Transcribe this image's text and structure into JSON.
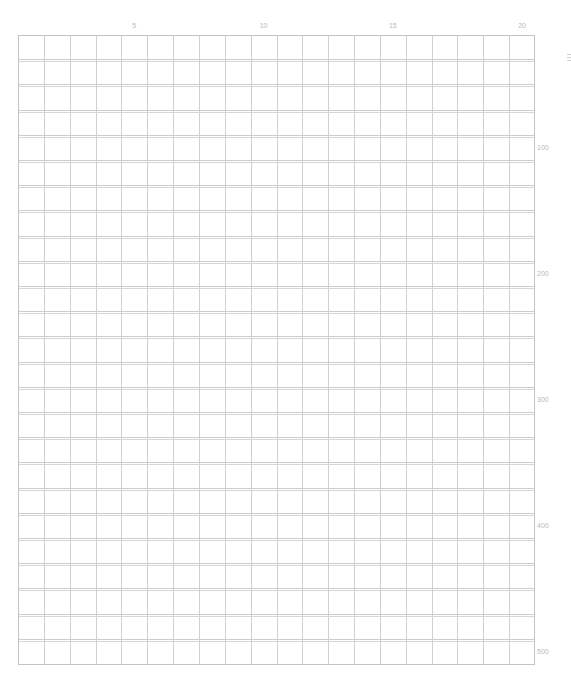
{
  "grid": {
    "columns": 20,
    "rows": 25,
    "line_color": "#cfcfcf",
    "label_color": "#b9b9b9"
  },
  "column_labels": [
    {
      "label": "5",
      "column": 5
    },
    {
      "label": "10",
      "column": 10
    },
    {
      "label": "15",
      "column": 15
    },
    {
      "label": "20",
      "column": 20
    }
  ],
  "row_labels": [
    {
      "label": "100",
      "row": 5
    },
    {
      "label": "200",
      "row": 10
    },
    {
      "label": "300",
      "row": 15
    },
    {
      "label": "400",
      "row": 20
    },
    {
      "label": "500",
      "row": 25
    }
  ],
  "icons": {
    "edge_mark": "menu-icon"
  }
}
